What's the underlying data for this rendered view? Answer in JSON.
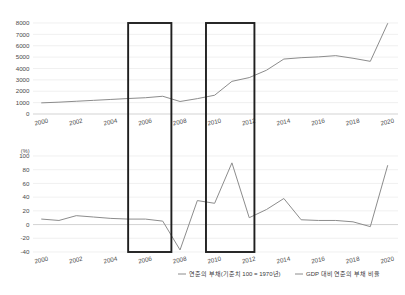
{
  "chart_data": [
    {
      "id": "top",
      "type": "line",
      "title": "",
      "xlabel": "",
      "ylabel": "",
      "unit": "",
      "x": [
        2000,
        2001,
        2002,
        2003,
        2004,
        2005,
        2006,
        2007,
        2008,
        2009,
        2010,
        2011,
        2012,
        2013,
        2014,
        2015,
        2016,
        2017,
        2018,
        2019,
        2020
      ],
      "series": [
        {
          "name": "연준의 부채(기준치 100 = 1970년)",
          "values": [
            980,
            1040,
            1120,
            1200,
            1280,
            1360,
            1430,
            1560,
            1100,
            1350,
            1650,
            2870,
            3200,
            3850,
            4830,
            4950,
            5020,
            5130,
            4900,
            4630,
            7950
          ]
        }
      ],
      "x_ticks": [
        "2000",
        "2002",
        "2004",
        "2006",
        "2008",
        "2010",
        "2012",
        "2014",
        "2016",
        "2018",
        "2020"
      ],
      "x_tick_values": [
        2000,
        2002,
        2004,
        2006,
        2008,
        2010,
        2012,
        2014,
        2016,
        2018,
        2020
      ],
      "y_ticks": [
        "0",
        "1000",
        "2000",
        "3000",
        "4000",
        "5000",
        "6000",
        "7000",
        "8000"
      ],
      "y_tick_values": [
        0,
        1000,
        2000,
        3000,
        4000,
        5000,
        6000,
        7000,
        8000
      ],
      "ylim": [
        0,
        8000
      ],
      "xlim": [
        1999.5,
        2020.6
      ],
      "grid": true,
      "legend_position": "bottom"
    },
    {
      "id": "bottom",
      "type": "line",
      "title": "",
      "xlabel": "",
      "ylabel": "",
      "unit": "(%)",
      "x": [
        2000,
        2001,
        2002,
        2003,
        2004,
        2005,
        2006,
        2007,
        2008,
        2009,
        2010,
        2011,
        2012,
        2013,
        2014,
        2015,
        2016,
        2017,
        2018,
        2019,
        2020
      ],
      "series": [
        {
          "name": "GDP 대비 연준의 부채 비율",
          "values": [
            8,
            6,
            13,
            11,
            9,
            8,
            8,
            5,
            -37,
            35,
            31,
            90,
            10,
            22,
            38,
            7,
            6,
            6,
            4,
            -3,
            86
          ]
        }
      ],
      "x_ticks": [
        "2000",
        "2002",
        "2004",
        "2006",
        "2008",
        "2010",
        "2012",
        "2014",
        "2016",
        "2018",
        "2020"
      ],
      "x_tick_values": [
        2000,
        2002,
        2004,
        2006,
        2008,
        2010,
        2012,
        2014,
        2016,
        2018,
        2020
      ],
      "y_ticks": [
        "-40",
        "-20",
        "0",
        "20",
        "40",
        "60",
        "80",
        "100"
      ],
      "y_tick_values": [
        -40,
        -20,
        0,
        20,
        40,
        60,
        80,
        100
      ],
      "ylim": [
        -40,
        100
      ],
      "xlim": [
        1999.5,
        2020.6
      ],
      "grid": true,
      "legend_position": "bottom"
    }
  ],
  "highlight_boxes": [
    {
      "label": "highlight-2005-2007",
      "x_start": 2005.0,
      "x_end": 2007.5
    },
    {
      "label": "highlight-2009-2012",
      "x_start": 2009.5,
      "x_end": 2012.3
    }
  ],
  "legend": {
    "items": [
      {
        "label": "연준의 부채(기준치 100 = 1970년)",
        "color": "#8c8c8c"
      },
      {
        "label": "GDP 대비 연준의 부채 비율",
        "color": "#8c8c8c"
      }
    ]
  },
  "colors": {
    "line": "#8c8c8c",
    "grid": "#e6e6e6",
    "axis": "#c8c8c8",
    "highlight": "#1f1f1f",
    "text": "#3a3a3a",
    "background": "#ffffff"
  }
}
